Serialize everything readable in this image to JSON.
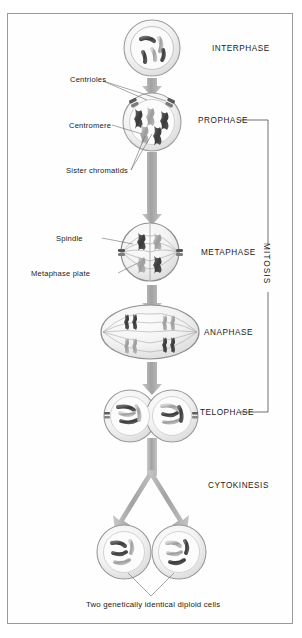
{
  "figure": {
    "background": "#ffffff",
    "border_color": "#9a9a9a",
    "ink": "#1a1a1a",
    "arrow_color": "#a8a8a8",
    "cell_membrane": "#b8b8b8",
    "cytoplasm": "#ededed"
  },
  "phases": {
    "interphase": "INTERPHASE",
    "prophase": "PROPHASE",
    "metaphase": "METAPHASE",
    "anaphase": "ANAPHASE",
    "telophase": "TELOPHASE",
    "cytokinesis": "CYTOKINESIS"
  },
  "bracket": {
    "label": "MITOSIS",
    "spans_from": "PROPHASE",
    "spans_to": "TELOPHASE"
  },
  "callouts": {
    "centrioles": "Centrioles",
    "centromere": "Centromere",
    "sister_chromatids": "Sister chromatids",
    "spindle": "Spindle",
    "metaphase_plate": "Metaphase plate"
  },
  "caption": {
    "bottom": "Two genetically identical diploid cells"
  },
  "stage_sequence": [
    {
      "name": "INTERPHASE",
      "shape": "circle",
      "cell_count": 1,
      "chromosome_count": 4,
      "condensed": false
    },
    {
      "name": "PROPHASE",
      "shape": "circle",
      "cell_count": 1,
      "chromosome_count": 4,
      "condensed": true
    },
    {
      "name": "METAPHASE",
      "shape": "circle",
      "cell_count": 1,
      "chromosome_count": 4,
      "aligned": true
    },
    {
      "name": "ANAPHASE",
      "shape": "ellipse",
      "cell_count": 1,
      "chromatid_groups": 4,
      "separating": true
    },
    {
      "name": "TELOPHASE",
      "shape": "double-circle",
      "cell_count": 2,
      "chromosome_count": 4
    },
    {
      "name": "CYTOKINESIS",
      "shape": "two-circles",
      "cell_count": 2,
      "chromosome_count": 4
    }
  ]
}
